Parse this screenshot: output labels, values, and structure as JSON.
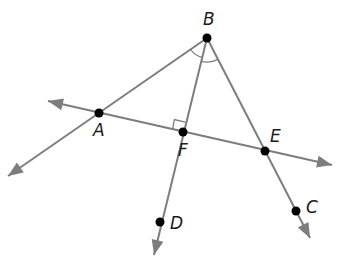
{
  "diagram": {
    "type": "geometry",
    "colors": {
      "line": "#7d7d7d",
      "point": "#000000",
      "label": "#1a1a1a",
      "background": "#ffffff"
    },
    "points": [
      {
        "name": "B",
        "x": 207,
        "y": 38,
        "label": "B",
        "lx": 203,
        "ly": 25
      },
      {
        "name": "A",
        "x": 99,
        "y": 113,
        "label": "A",
        "lx": 93,
        "ly": 136
      },
      {
        "name": "F",
        "x": 183,
        "y": 132,
        "label": "F",
        "lx": 178,
        "ly": 156
      },
      {
        "name": "E",
        "x": 265,
        "y": 151,
        "label": "E",
        "lx": 270,
        "ly": 142
      },
      {
        "name": "D",
        "x": 160,
        "y": 222,
        "label": "D",
        "lx": 170,
        "ly": 229
      },
      {
        "name": "C",
        "x": 296,
        "y": 211,
        "label": "C",
        "lx": 306,
        "ly": 213
      }
    ],
    "lines": [
      {
        "name": "line-AE",
        "from": [
          48,
          101
        ],
        "to": [
          332,
          165
        ],
        "arrows": [
          "start",
          "end"
        ]
      },
      {
        "name": "ray-BA",
        "from": [
          207,
          38
        ],
        "to": [
          8,
          176
        ],
        "arrows": [
          "end"
        ]
      },
      {
        "name": "ray-BD",
        "from": [
          207,
          38
        ],
        "to": [
          154,
          255
        ],
        "arrows": [
          "end"
        ]
      },
      {
        "name": "ray-BC",
        "from": [
          207,
          38
        ],
        "to": [
          310,
          238
        ],
        "arrows": [
          "end"
        ]
      }
    ],
    "marks": {
      "right_angle_at": "F",
      "angle_arcs_at": "B",
      "angle_arcs_count": 2
    }
  }
}
